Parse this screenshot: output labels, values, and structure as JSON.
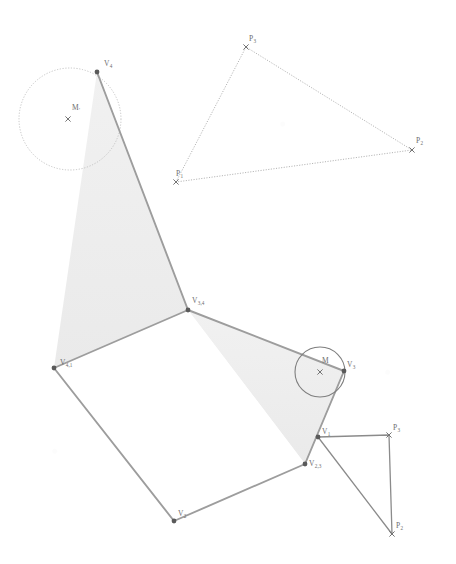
{
  "figure": {
    "type": "geometry-diagram",
    "background_color": "#ffffff",
    "stroke_color": "#9a9a9a",
    "dotted_stroke_color": "#b5b5b5",
    "dark_stroke_color": "#6f6f6f",
    "fill_color": "#eeeeee",
    "label_color": "#6d6d6d",
    "vertex_dot_color": "#5a5a5a",
    "width": 456,
    "height": 564
  },
  "labels": {
    "v4": {
      "base": "V",
      "sub": "4",
      "x": 104,
      "y": 66
    },
    "m_prime": {
      "base": "M",
      "sub": "'",
      "x": 72,
      "y": 110
    },
    "v34": {
      "base": "V",
      "sub": "3,4",
      "x": 192,
      "y": 303
    },
    "v41": {
      "base": "V",
      "sub": "4,1",
      "x": 60,
      "y": 365
    },
    "v3": {
      "base": "V",
      "sub": "3",
      "x": 347,
      "y": 367
    },
    "m": {
      "base": "M",
      "sub": "",
      "x": 322,
      "y": 363
    },
    "v23": {
      "base": "V",
      "sub": "2,3",
      "x": 309,
      "y": 466
    },
    "v2": {
      "base": "V",
      "sub": "2",
      "x": 178,
      "y": 516
    },
    "v1": {
      "base": "V",
      "sub": "1",
      "x": 322,
      "y": 434
    },
    "p1_top": {
      "base": "P",
      "sub": "1",
      "x": 176,
      "y": 176
    },
    "p2_top": {
      "base": "P",
      "sub": "2",
      "x": 416,
      "y": 143
    },
    "p3_top": {
      "base": "P",
      "sub": "3",
      "x": 249,
      "y": 41
    },
    "p2_bot": {
      "base": "P",
      "sub": "2",
      "x": 396,
      "y": 528
    },
    "p3_bot": {
      "base": "P",
      "sub": "3",
      "x": 393,
      "y": 430
    }
  },
  "points": {
    "V4": {
      "x": 97,
      "y": 72,
      "marker": "dot"
    },
    "V34": {
      "x": 188,
      "y": 310,
      "marker": "dot"
    },
    "V41": {
      "x": 54,
      "y": 368,
      "marker": "dot"
    },
    "V3": {
      "x": 344,
      "y": 371,
      "marker": "dot"
    },
    "V23": {
      "x": 305,
      "y": 464,
      "marker": "dot"
    },
    "V2": {
      "x": 174,
      "y": 521,
      "marker": "dot"
    },
    "V1": {
      "x": 318,
      "y": 437,
      "marker": "dot"
    },
    "Mprime": {
      "x": 68,
      "y": 119,
      "marker": "cross"
    },
    "M": {
      "x": 320,
      "y": 372,
      "marker": "cross"
    },
    "P1t": {
      "x": 176,
      "y": 182,
      "marker": "cross"
    },
    "P2t": {
      "x": 412,
      "y": 150,
      "marker": "cross"
    },
    "P3t": {
      "x": 246,
      "y": 47,
      "marker": "cross"
    },
    "P2b": {
      "x": 392,
      "y": 534,
      "marker": "cross"
    },
    "P3b": {
      "x": 389,
      "y": 435,
      "marker": "cross"
    }
  },
  "circles": {
    "circle_m_prime": {
      "cx": 70,
      "cy": 119,
      "r": 51,
      "style": "dotted"
    },
    "circle_m": {
      "cx": 320,
      "cy": 372,
      "r": 25,
      "style": "solid"
    }
  },
  "shapes": {
    "shaded_triangle_upper": {
      "name": "upper-shaded-triangle",
      "vertices": "97,72 188,310 54,368"
    },
    "shaded_triangle_lower": {
      "name": "lower-shaded-triangle",
      "vertices": "188,310 344,371 305,464"
    },
    "white_pentagon": {
      "name": "white-pentagon-core",
      "vertices": "54,368 188,310 305,464 174,521"
    }
  },
  "polylines": {
    "main_outline": "97,72 188,310 54,368 174,521 305,464 344,371 188,310",
    "top_triangle": "176,182 246,47 412,150 176,182",
    "bottom_triangle": "318,437 389,435 392,534 318,437"
  }
}
